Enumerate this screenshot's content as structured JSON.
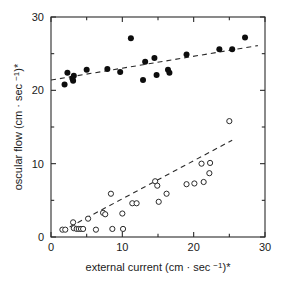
{
  "chart_data": {
    "type": "scatter",
    "title": "",
    "xlabel": "external current (cm · sec −1)*",
    "ylabel": "oscular flow (cm · sec −1)*",
    "xlabel_parts": {
      "main": "external current (cm · sec ",
      "exponent": "−1",
      "tail": ")*"
    },
    "ylabel_parts": {
      "main": "oscular flow (cm · sec ",
      "exponent": "−1",
      "tail": ")*"
    },
    "xlim": [
      0,
      30
    ],
    "ylim": [
      0,
      30
    ],
    "xticks": [
      0,
      10,
      20,
      30
    ],
    "yticks": [
      0,
      10,
      20,
      30
    ],
    "xtick_labels": [
      "0",
      "10",
      "20",
      "30"
    ],
    "ytick_labels": [
      "0",
      "10",
      "20",
      "30"
    ],
    "xminor_ticks": [
      5,
      15,
      25
    ],
    "yminor_ticks": [
      5,
      15,
      25
    ],
    "grid": false,
    "legend": "none",
    "frame": "box",
    "series": [
      {
        "name": "filled-circles",
        "marker": "filled circle",
        "color": "#0d0d0d",
        "points": [
          [
            1.9,
            20.8
          ],
          [
            2.3,
            22.4
          ],
          [
            3.0,
            21.6
          ],
          [
            3.1,
            21.3
          ],
          [
            3.2,
            22.0
          ],
          [
            5.0,
            22.8
          ],
          [
            7.9,
            22.9
          ],
          [
            9.7,
            22.5
          ],
          [
            11.2,
            27.1
          ],
          [
            12.9,
            21.4
          ],
          [
            13.2,
            23.9
          ],
          [
            14.5,
            24.4
          ],
          [
            14.8,
            22.1
          ],
          [
            16.4,
            22.8
          ],
          [
            16.6,
            22.4
          ],
          [
            19.0,
            24.9
          ],
          [
            23.6,
            25.6
          ],
          [
            25.4,
            25.6
          ],
          [
            27.2,
            27.2
          ]
        ]
      },
      {
        "name": "open-circles",
        "marker": "open circle",
        "color": "#ffffff",
        "points": [
          [
            1.6,
            1.0
          ],
          [
            2.0,
            1.0
          ],
          [
            3.1,
            2.0
          ],
          [
            3.2,
            1.2
          ],
          [
            3.6,
            1.1
          ],
          [
            3.9,
            1.1
          ],
          [
            4.2,
            1.1
          ],
          [
            4.5,
            1.1
          ],
          [
            5.2,
            2.5
          ],
          [
            6.3,
            1.0
          ],
          [
            7.3,
            3.3
          ],
          [
            7.6,
            3.1
          ],
          [
            8.4,
            5.9
          ],
          [
            8.6,
            1.1
          ],
          [
            10.0,
            3.2
          ],
          [
            10.1,
            1.1
          ],
          [
            11.4,
            4.6
          ],
          [
            12.0,
            4.6
          ],
          [
            14.6,
            7.6
          ],
          [
            14.9,
            7.0
          ],
          [
            15.1,
            4.8
          ],
          [
            16.2,
            5.9
          ],
          [
            19.0,
            7.2
          ],
          [
            20.1,
            7.3
          ],
          [
            21.1,
            10.0
          ],
          [
            21.4,
            7.5
          ],
          [
            22.2,
            8.7
          ],
          [
            22.3,
            10.1
          ],
          [
            25.0,
            15.8
          ]
        ]
      }
    ],
    "trend_lines": [
      {
        "name": "upper-trend-line",
        "style": "dashed",
        "from": [
          0.0,
          21.4
        ],
        "to": [
          29.0,
          26.1
        ]
      },
      {
        "name": "lower-trend-line",
        "style": "dashed",
        "from": [
          1.5,
          0.8
        ],
        "to": [
          25.4,
          13.2
        ]
      }
    ]
  }
}
